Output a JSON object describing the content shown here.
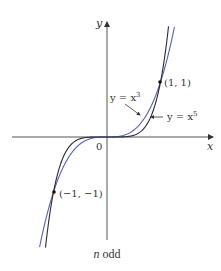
{
  "figure": {
    "caption_var": "n",
    "caption_rest": " odd",
    "axes": {
      "x_label": "x",
      "y_label": "y",
      "origin_label": "0"
    },
    "curves": [
      {
        "name": "y = x^3",
        "label_prefix": "y = x",
        "exponent": "3",
        "color": "#5561b0"
      },
      {
        "name": "y = x^5",
        "label_prefix": "y = x",
        "exponent": "5",
        "color": "#2a2a35"
      }
    ],
    "points": [
      {
        "label": "(1, 1)",
        "x": 1,
        "y": 1
      },
      {
        "label": "(−1, −1)",
        "x": -1,
        "y": -1
      }
    ]
  },
  "chart_data": {
    "type": "line",
    "title": "n odd",
    "xlabel": "x",
    "ylabel": "y",
    "series": [
      {
        "name": "y = x^3",
        "function": "x^3",
        "x_range": [
          -1.26,
          1.26
        ]
      },
      {
        "name": "y = x^5",
        "function": "x^5",
        "x_range": [
          -1.15,
          1.15
        ]
      }
    ],
    "marked_points": [
      [
        1,
        1
      ],
      [
        -1,
        -1
      ]
    ],
    "annotations": [
      "y = x^3",
      "y = x^5",
      "(1, 1)",
      "(-1, -1)",
      "0"
    ],
    "grid": false
  }
}
